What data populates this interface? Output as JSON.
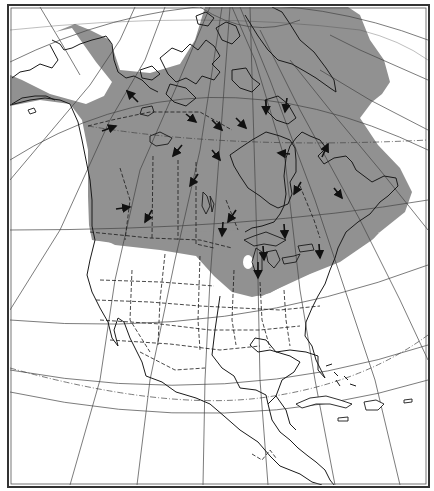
{
  "map": {
    "type": "range-map",
    "region": "North America",
    "projection": "conic graticule with dashed Arctic Circle and Tropic of Cancer",
    "legend": null,
    "title": null,
    "colors": {
      "range_fill": "#919191",
      "background": "#ffffff",
      "lines": "#1a1a1a",
      "graticule": "#444444"
    },
    "range_description": "Shaded range covering Alaska (except a northern white band), all of Canada including the Arctic archipelago and Greenland's west coast area, southern Greenland region and the northern United States (Great Lakes region), with one unshaded hole in Wisconsin/Illinois area.",
    "arrows": {
      "count": 22,
      "meaning": "Directional movement arrows within the shaded range",
      "items": [
        {
          "x": 130,
          "y": 95,
          "dir": "northwest"
        },
        {
          "x": 110,
          "y": 129,
          "dir": "east"
        },
        {
          "x": 177,
          "y": 150,
          "dir": "southwest"
        },
        {
          "x": 193,
          "y": 180,
          "dir": "southwest"
        },
        {
          "x": 124,
          "y": 208,
          "dir": "east"
        },
        {
          "x": 147,
          "y": 216,
          "dir": "southwest"
        },
        {
          "x": 190,
          "y": 120,
          "dir": "southeast"
        },
        {
          "x": 217,
          "y": 126,
          "dir": "southeast"
        },
        {
          "x": 217,
          "y": 155,
          "dir": "southeast"
        },
        {
          "x": 240,
          "y": 123,
          "dir": "southeast"
        },
        {
          "x": 266,
          "y": 115,
          "dir": "south"
        },
        {
          "x": 287,
          "y": 105,
          "dir": "south"
        },
        {
          "x": 285,
          "y": 154,
          "dir": "west"
        },
        {
          "x": 325,
          "y": 150,
          "dir": "northeast"
        },
        {
          "x": 296,
          "y": 188,
          "dir": "southwest"
        },
        {
          "x": 338,
          "y": 193,
          "dir": "southwest"
        },
        {
          "x": 230,
          "y": 215,
          "dir": "southwest"
        },
        {
          "x": 230,
          "y": 243,
          "dir": "south"
        },
        {
          "x": 287,
          "y": 232,
          "dir": "south"
        },
        {
          "x": 223,
          "y": 228,
          "dir": "south"
        },
        {
          "x": 258,
          "y": 270,
          "dir": "south"
        },
        {
          "x": 319,
          "y": 252,
          "dir": "south"
        }
      ]
    }
  }
}
